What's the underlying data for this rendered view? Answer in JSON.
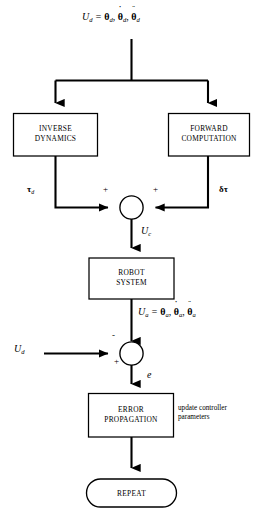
{
  "diagram": {
    "type": "control-system-block-diagram",
    "title_text": "",
    "background_color": "#ffffff",
    "line_color": "#000000",
    "nodes": {
      "input_top": {
        "name": "desired-trajectory-input",
        "text": "U_d = θ_d, θ̇_d, θ̈_d",
        "symbol": "U",
        "symbol_sub": "d",
        "equals": "=",
        "theta": "θ",
        "theta_sub": "d",
        "dot_accent": "˙",
        "ddot_accent": "¨",
        "comma": ","
      },
      "inverse_dynamics": {
        "name": "inverse-dynamics-box",
        "line1": "INVERSE",
        "line2": "DYNAMICS"
      },
      "forward_computation": {
        "name": "forward-computation-box",
        "line1": "FORWARD",
        "line2": "COMPUTATION"
      },
      "robot_system": {
        "name": "robot-system-box",
        "line1": "ROBOT",
        "line2": "SYSTEM"
      },
      "error_propagation": {
        "name": "error-propagation-box",
        "line1": "ERROR",
        "line2": "PROPAGATION"
      },
      "repeat": {
        "name": "repeat-terminator",
        "label": "REPEAT"
      },
      "sum_junction_1": {
        "name": "summing-junction-upper",
        "sign_left": "+",
        "sign_right": "+"
      },
      "sum_junction_2": {
        "name": "summing-junction-lower",
        "sign_top": "-",
        "sign_left": "+"
      }
    },
    "signals": {
      "tau_d": {
        "name": "tau-d-signal-label",
        "greek": "τ",
        "sub": "d"
      },
      "delta_tau": {
        "name": "delta-tau-signal-label",
        "greek": "δτ"
      },
      "u_c": {
        "name": "uc-signal-label",
        "symbol": "U",
        "sub": "c"
      },
      "u_a_measured": {
        "name": "ua-measured-signal-label",
        "symbol": "U",
        "sub": "a",
        "equals": "=",
        "theta": "θ",
        "theta_sub": "a",
        "dot_accent": "˙",
        "ddot_accent": "¨",
        "comma": ","
      },
      "u_d_feedback": {
        "name": "ud-reference-signal-label",
        "symbol": "U",
        "sub": "d"
      },
      "error": {
        "name": "error-signal-label",
        "symbol": "e"
      }
    },
    "annotations": {
      "update_controller": {
        "name": "update-controller-parameters-note",
        "line1": "update controller",
        "line2": "parameters"
      }
    }
  }
}
